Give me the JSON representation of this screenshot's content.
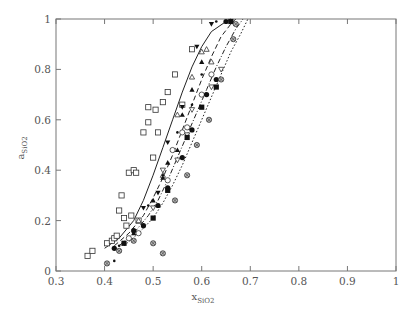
{
  "chart_data": {
    "type": "scatter",
    "title": "",
    "xlabel": "x",
    "xlabel_sub": "SiO2",
    "ylabel": "a",
    "ylabel_sub": "SiO2",
    "xlim": [
      0.3,
      1.0
    ],
    "ylim": [
      0,
      1.0
    ],
    "grid": false,
    "legend": "none",
    "x_ticks": [
      0.3,
      0.4,
      0.5,
      0.6,
      0.7,
      0.8,
      0.9,
      1.0
    ],
    "x_tick_labels": [
      "0.3",
      "0.4",
      "0.5",
      "0.6",
      "0.7",
      "0.8",
      "0.9",
      "1"
    ],
    "y_ticks": [
      0,
      0.2,
      0.4,
      0.6,
      0.8,
      1.0
    ],
    "y_tick_labels": [
      "0",
      "0.2",
      "0.4",
      "0.6",
      "0.8",
      "1"
    ],
    "series": [
      {
        "name": "open-square",
        "marker": "square-open",
        "points": [
          [
            0.365,
            0.06
          ],
          [
            0.375,
            0.08
          ],
          [
            0.405,
            0.11
          ],
          [
            0.415,
            0.12
          ],
          [
            0.42,
            0.13
          ],
          [
            0.425,
            0.14
          ],
          [
            0.43,
            0.24
          ],
          [
            0.435,
            0.3
          ],
          [
            0.44,
            0.21
          ],
          [
            0.445,
            0.18
          ],
          [
            0.45,
            0.39
          ],
          [
            0.455,
            0.22
          ],
          [
            0.46,
            0.4
          ],
          [
            0.465,
            0.39
          ],
          [
            0.47,
            0.2
          ],
          [
            0.48,
            0.55
          ],
          [
            0.49,
            0.59
          ],
          [
            0.49,
            0.65
          ],
          [
            0.5,
            0.45
          ],
          [
            0.505,
            0.64
          ],
          [
            0.51,
            0.55
          ],
          [
            0.52,
            0.67
          ],
          [
            0.53,
            0.71
          ],
          [
            0.545,
            0.78
          ],
          [
            0.56,
            0.66
          ],
          [
            0.58,
            0.88
          ]
        ]
      },
      {
        "name": "open-circle",
        "marker": "circle-open",
        "points": [
          [
            0.45,
            0.13
          ],
          [
            0.47,
            0.15
          ],
          [
            0.53,
            0.36
          ],
          [
            0.54,
            0.48
          ],
          [
            0.56,
            0.55
          ],
          [
            0.57,
            0.57
          ],
          [
            0.6,
            0.7
          ],
          [
            0.62,
            0.78
          ]
        ]
      },
      {
        "name": "open-triangle-up",
        "marker": "triangle-up-open",
        "points": [
          [
            0.47,
            0.2
          ],
          [
            0.52,
            0.38
          ],
          [
            0.55,
            0.62
          ],
          [
            0.58,
            0.77
          ],
          [
            0.6,
            0.87
          ],
          [
            0.61,
            0.88
          ],
          [
            0.62,
            0.83
          ]
        ]
      },
      {
        "name": "open-triangle-down",
        "marker": "triangle-down-open",
        "points": [
          [
            0.5,
            0.25
          ],
          [
            0.52,
            0.4
          ],
          [
            0.55,
            0.44
          ],
          [
            0.57,
            0.54
          ],
          [
            0.58,
            0.64
          ],
          [
            0.62,
            0.73
          ],
          [
            0.64,
            0.8
          ]
        ]
      },
      {
        "name": "filled-square",
        "marker": "square-filled",
        "points": [
          [
            0.44,
            0.11
          ],
          [
            0.5,
            0.21
          ],
          [
            0.53,
            0.32
          ],
          [
            0.57,
            0.53
          ],
          [
            0.6,
            0.65
          ],
          [
            0.63,
            0.73
          ],
          [
            0.66,
            0.99
          ]
        ]
      },
      {
        "name": "filled-circle",
        "marker": "circle-filled",
        "points": [
          [
            0.42,
            0.09
          ],
          [
            0.46,
            0.16
          ],
          [
            0.48,
            0.18
          ],
          [
            0.51,
            0.26
          ],
          [
            0.53,
            0.33
          ],
          [
            0.56,
            0.45
          ],
          [
            0.58,
            0.56
          ],
          [
            0.61,
            0.7
          ],
          [
            0.63,
            0.76
          ],
          [
            0.65,
            0.99
          ]
        ]
      },
      {
        "name": "filled-triangle-up",
        "marker": "triangle-up-filled",
        "points": [
          [
            0.46,
            0.15
          ],
          [
            0.5,
            0.28
          ],
          [
            0.52,
            0.37
          ],
          [
            0.53,
            0.43
          ],
          [
            0.55,
            0.48
          ],
          [
            0.56,
            0.62
          ],
          [
            0.58,
            0.72
          ],
          [
            0.6,
            0.83
          ]
        ]
      },
      {
        "name": "filled-triangle-down",
        "marker": "triangle-down-filled",
        "points": [
          [
            0.48,
            0.25
          ],
          [
            0.51,
            0.31
          ],
          [
            0.53,
            0.51
          ],
          [
            0.56,
            0.65
          ],
          [
            0.59,
            0.89
          ],
          [
            0.62,
            0.98
          ]
        ]
      },
      {
        "name": "crossed-circle",
        "marker": "circle-crossed",
        "points": [
          [
            0.405,
            0.03
          ],
          [
            0.43,
            0.08
          ],
          [
            0.46,
            0.12
          ],
          [
            0.5,
            0.11
          ],
          [
            0.52,
            0.07
          ],
          [
            0.545,
            0.28
          ],
          [
            0.57,
            0.38
          ],
          [
            0.59,
            0.5
          ],
          [
            0.615,
            0.6
          ],
          [
            0.64,
            0.76
          ],
          [
            0.665,
            0.92
          ],
          [
            0.67,
            0.98
          ]
        ]
      },
      {
        "name": "small-dot",
        "marker": "dot",
        "points": [
          [
            0.42,
            0.04
          ],
          [
            0.43,
            0.1
          ],
          [
            0.49,
            0.26
          ],
          [
            0.52,
            0.38
          ],
          [
            0.55,
            0.55
          ],
          [
            0.58,
            0.66
          ],
          [
            0.6,
            0.78
          ],
          [
            0.63,
            0.99
          ]
        ]
      }
    ],
    "curves": [
      {
        "name": "solid",
        "style": "solid",
        "points": [
          [
            0.4,
            0.09
          ],
          [
            0.43,
            0.13
          ],
          [
            0.46,
            0.2
          ],
          [
            0.48,
            0.28
          ],
          [
            0.5,
            0.38
          ],
          [
            0.52,
            0.49
          ],
          [
            0.54,
            0.6
          ],
          [
            0.56,
            0.71
          ],
          [
            0.58,
            0.81
          ],
          [
            0.6,
            0.89
          ],
          [
            0.62,
            0.95
          ],
          [
            0.65,
            0.99
          ],
          [
            0.66,
            1.0
          ]
        ]
      },
      {
        "name": "long-dash",
        "style": "dash",
        "points": [
          [
            0.42,
            0.1
          ],
          [
            0.45,
            0.15
          ],
          [
            0.48,
            0.22
          ],
          [
            0.5,
            0.29
          ],
          [
            0.52,
            0.37
          ],
          [
            0.54,
            0.46
          ],
          [
            0.56,
            0.56
          ],
          [
            0.58,
            0.66
          ],
          [
            0.6,
            0.76
          ],
          [
            0.62,
            0.85
          ],
          [
            0.64,
            0.93
          ],
          [
            0.66,
            0.98
          ],
          [
            0.67,
            1.0
          ]
        ]
      },
      {
        "name": "dash-dot",
        "style": "dashdot",
        "points": [
          [
            0.43,
            0.1
          ],
          [
            0.46,
            0.15
          ],
          [
            0.49,
            0.22
          ],
          [
            0.51,
            0.28
          ],
          [
            0.53,
            0.36
          ],
          [
            0.55,
            0.45
          ],
          [
            0.57,
            0.54
          ],
          [
            0.59,
            0.63
          ],
          [
            0.61,
            0.72
          ],
          [
            0.63,
            0.81
          ],
          [
            0.65,
            0.89
          ],
          [
            0.67,
            0.96
          ],
          [
            0.685,
            1.0
          ]
        ]
      },
      {
        "name": "dotted",
        "style": "dot",
        "points": [
          [
            0.44,
            0.1
          ],
          [
            0.47,
            0.15
          ],
          [
            0.5,
            0.21
          ],
          [
            0.52,
            0.27
          ],
          [
            0.54,
            0.34
          ],
          [
            0.56,
            0.42
          ],
          [
            0.58,
            0.51
          ],
          [
            0.6,
            0.6
          ],
          [
            0.62,
            0.69
          ],
          [
            0.64,
            0.78
          ],
          [
            0.66,
            0.87
          ],
          [
            0.68,
            0.94
          ],
          [
            0.695,
            1.0
          ]
        ]
      }
    ]
  }
}
